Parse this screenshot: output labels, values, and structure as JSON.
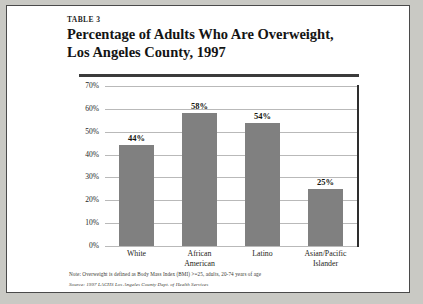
{
  "card": {
    "table_label": "TABLE 3",
    "title": "Percentage of Adults Who Are Overweight,\nLos Angeles County, 1997",
    "note": "Note: Overweight is defined as Body Mass Index (BMI) >=25, adults, 20-74 years of age",
    "source": "Source: 1997 LACHS Los Angeles County Dept. of Health Services"
  },
  "chart_data": {
    "type": "bar",
    "title": "Percentage of Adults Who Are Overweight, Los Angeles County, 1997",
    "xlabel": "",
    "ylabel": "",
    "categories": [
      "White",
      "African\nAmerican",
      "Latino",
      "Asian/Pacific\nIslander"
    ],
    "values": [
      44,
      58,
      54,
      25
    ],
    "value_labels": [
      "44%",
      "58%",
      "54%",
      "25%"
    ],
    "ylim": [
      0,
      70
    ],
    "ytick_values": [
      70,
      60,
      50,
      40,
      30,
      20,
      10,
      0
    ],
    "ytick_labels": [
      "70%",
      "60%",
      "50%",
      "40%",
      "30%",
      "20%",
      "10%",
      "0%"
    ],
    "grid": true,
    "legend": "none",
    "bar_color": "#808080",
    "units": "percent"
  }
}
